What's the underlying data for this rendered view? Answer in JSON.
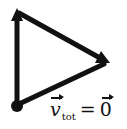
{
  "diagram": {
    "vertices": {
      "top": [
        17,
        12
      ],
      "right": [
        108,
        62
      ],
      "bottom": [
        17,
        106
      ]
    },
    "edges": [
      {
        "from": "bottom",
        "to": "top",
        "arrow": "top"
      },
      {
        "from": "top",
        "to": "right",
        "arrow": "right"
      },
      {
        "from": "right",
        "to": "bottom",
        "arrow": "none"
      }
    ],
    "origin_dot": [
      17,
      106
    ],
    "stroke_color": "#111111",
    "background": "#ffffff"
  },
  "label": {
    "vector": "v",
    "subscript": "tot",
    "equals": "=",
    "result": "0"
  }
}
